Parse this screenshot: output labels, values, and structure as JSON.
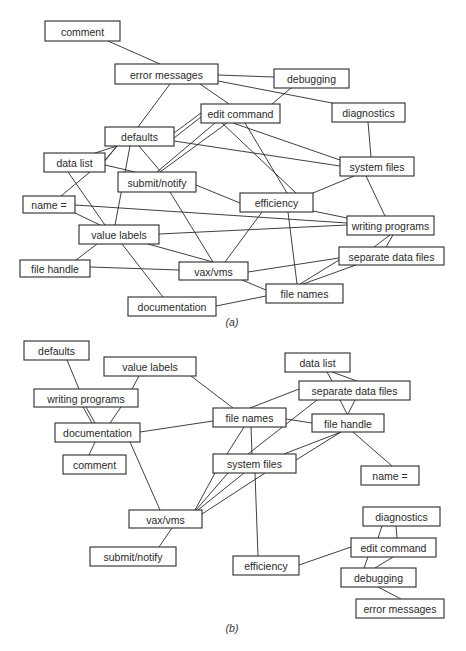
{
  "panels": [
    {
      "id": "a",
      "caption": "(a)",
      "caption_pos": [
        232,
        326
      ],
      "nodes": [
        {
          "id": "comment",
          "label": "comment",
          "x": 45,
          "y": 21,
          "w": 75,
          "h": 20
        },
        {
          "id": "error_messages",
          "label": "error messages",
          "x": 115,
          "y": 64,
          "w": 103,
          "h": 20
        },
        {
          "id": "debugging",
          "label": "debugging",
          "x": 274,
          "y": 69,
          "w": 75,
          "h": 19
        },
        {
          "id": "edit_command",
          "label": "edit command",
          "x": 201,
          "y": 104,
          "w": 79,
          "h": 19
        },
        {
          "id": "diagnostics",
          "label": "diagnostics",
          "x": 332,
          "y": 103,
          "w": 73,
          "h": 19
        },
        {
          "id": "defaults",
          "label": "defaults",
          "x": 105,
          "y": 127,
          "w": 69,
          "h": 19
        },
        {
          "id": "data_list",
          "label": "data list",
          "x": 44,
          "y": 153,
          "w": 61,
          "h": 19
        },
        {
          "id": "system_files",
          "label": "system files",
          "x": 340,
          "y": 157,
          "w": 74,
          "h": 19
        },
        {
          "id": "submit_notify",
          "label": "submit/notify",
          "x": 118,
          "y": 172,
          "w": 78,
          "h": 20
        },
        {
          "id": "efficiency",
          "label": "efficiency",
          "x": 240,
          "y": 193,
          "w": 73,
          "h": 19
        },
        {
          "id": "name_eq",
          "label": "name =",
          "x": 23,
          "y": 196,
          "w": 52,
          "h": 17
        },
        {
          "id": "writing_programs",
          "label": "writing programs",
          "x": 347,
          "y": 216,
          "w": 87,
          "h": 19
        },
        {
          "id": "value_labels",
          "label": "value labels",
          "x": 79,
          "y": 225,
          "w": 80,
          "h": 19
        },
        {
          "id": "separate_data_files",
          "label": "separate data files",
          "x": 339,
          "y": 247,
          "w": 105,
          "h": 18
        },
        {
          "id": "file_handle",
          "label": "file handle",
          "x": 20,
          "y": 260,
          "w": 70,
          "h": 17
        },
        {
          "id": "vax_vms",
          "label": "vax/vms",
          "x": 179,
          "y": 262,
          "w": 69,
          "h": 18
        },
        {
          "id": "file_names",
          "label": "file names",
          "x": 266,
          "y": 284,
          "w": 77,
          "h": 19
        },
        {
          "id": "documentation",
          "label": "documentation",
          "x": 128,
          "y": 297,
          "w": 88,
          "h": 19
        }
      ],
      "edges": [
        [
          108,
          41,
          160,
          64
        ],
        [
          218,
          75,
          274,
          77
        ],
        [
          218,
          81,
          332,
          103
        ],
        [
          200,
          84,
          229,
          104
        ],
        [
          170,
          84,
          138,
          127
        ],
        [
          291,
          88,
          272,
          104
        ],
        [
          174,
          133,
          201,
          113
        ],
        [
          174,
          138,
          201,
          117
        ],
        [
          174,
          141,
          340,
          166
        ],
        [
          215,
          123,
          157,
          172
        ],
        [
          227,
          123,
          160,
          172
        ],
        [
          233,
          123,
          340,
          160
        ],
        [
          222,
          123,
          296,
          193
        ],
        [
          245,
          123,
          287,
          193
        ],
        [
          117,
          146,
          95,
          153
        ],
        [
          117,
          146,
          105,
          160
        ],
        [
          117,
          146,
          96,
          172
        ],
        [
          130,
          146,
          115,
          225
        ],
        [
          139,
          146,
          161,
          172
        ],
        [
          105,
          165,
          135,
          172
        ],
        [
          90,
          172,
          61,
          196
        ],
        [
          68,
          172,
          105,
          225
        ],
        [
          196,
          185,
          240,
          203
        ],
        [
          170,
          192,
          213,
          262
        ],
        [
          262,
          212,
          225,
          262
        ],
        [
          288,
          212,
          297,
          284
        ],
        [
          313,
          211,
          347,
          218
        ],
        [
          75,
          205,
          347,
          223
        ],
        [
          159,
          234,
          347,
          225
        ],
        [
          368,
          122,
          371,
          157
        ],
        [
          366,
          176,
          385,
          216
        ],
        [
          354,
          176,
          313,
          193
        ],
        [
          75,
          213,
          100,
          225
        ],
        [
          97,
          244,
          76,
          260
        ],
        [
          90,
          267,
          179,
          270
        ],
        [
          148,
          244,
          213,
          262
        ],
        [
          122,
          244,
          163,
          297
        ],
        [
          248,
          272,
          339,
          258
        ],
        [
          242,
          280,
          266,
          290
        ],
        [
          216,
          306,
          266,
          296
        ],
        [
          300,
          284,
          339,
          260
        ],
        [
          303,
          284,
          356,
          265
        ],
        [
          374,
          247,
          390,
          235
        ],
        [
          386,
          247,
          393,
          235
        ]
      ]
    },
    {
      "id": "b",
      "caption": "(b)",
      "caption_pos": [
        232,
        632
      ],
      "nodes": [
        {
          "id": "defaults",
          "label": "defaults",
          "x": 24,
          "y": 341,
          "w": 65,
          "h": 19
        },
        {
          "id": "value_labels",
          "label": "value labels",
          "x": 104,
          "y": 357,
          "w": 92,
          "h": 19
        },
        {
          "id": "data_list",
          "label": "data list",
          "x": 285,
          "y": 353,
          "w": 65,
          "h": 19
        },
        {
          "id": "writing_programs",
          "label": "writing programs",
          "x": 34,
          "y": 389,
          "w": 104,
          "h": 18
        },
        {
          "id": "separate_data_files",
          "label": "separate data files",
          "x": 299,
          "y": 381,
          "w": 111,
          "h": 19
        },
        {
          "id": "file_names",
          "label": "file names",
          "x": 213,
          "y": 408,
          "w": 73,
          "h": 19
        },
        {
          "id": "file_handle",
          "label": "file handle",
          "x": 312,
          "y": 414,
          "w": 72,
          "h": 18
        },
        {
          "id": "documentation",
          "label": "documentation",
          "x": 55,
          "y": 423,
          "w": 85,
          "h": 19
        },
        {
          "id": "comment",
          "label": "comment",
          "x": 63,
          "y": 455,
          "w": 63,
          "h": 19
        },
        {
          "id": "system_files",
          "label": "system files",
          "x": 213,
          "y": 454,
          "w": 83,
          "h": 19
        },
        {
          "id": "name_eq",
          "label": "name =",
          "x": 361,
          "y": 466,
          "w": 58,
          "h": 19
        },
        {
          "id": "vax_vms",
          "label": "vax/vms",
          "x": 129,
          "y": 510,
          "w": 73,
          "h": 18
        },
        {
          "id": "submit_notify",
          "label": "submit/notify",
          "x": 90,
          "y": 547,
          "w": 86,
          "h": 19
        },
        {
          "id": "diagnostics",
          "label": "diagnostics",
          "x": 363,
          "y": 507,
          "w": 77,
          "h": 19
        },
        {
          "id": "edit_command",
          "label": "edit command",
          "x": 351,
          "y": 538,
          "w": 85,
          "h": 19
        },
        {
          "id": "efficiency",
          "label": "efficiency",
          "x": 233,
          "y": 556,
          "w": 66,
          "h": 19
        },
        {
          "id": "debugging",
          "label": "debugging",
          "x": 341,
          "y": 568,
          "w": 75,
          "h": 19
        },
        {
          "id": "error_messages",
          "label": "error messages",
          "x": 356,
          "y": 599,
          "w": 88,
          "h": 19
        }
      ],
      "edges": [
        [
          67,
          360,
          79,
          389
        ],
        [
          139,
          376,
          132,
          389
        ],
        [
          191,
          376,
          233,
          408
        ],
        [
          83,
          407,
          92,
          423
        ],
        [
          86,
          407,
          95,
          423
        ],
        [
          121,
          407,
          110,
          423
        ],
        [
          140,
          432,
          213,
          421
        ],
        [
          95,
          442,
          89,
          455
        ],
        [
          130,
          442,
          160,
          510
        ],
        [
          327,
          372,
          332,
          381
        ],
        [
          332,
          372,
          357,
          381
        ],
        [
          299,
          389,
          250,
          408
        ],
        [
          340,
          400,
          347,
          414
        ],
        [
          355,
          400,
          348,
          414
        ],
        [
          286,
          419,
          312,
          423
        ],
        [
          317,
          400,
          248,
          454
        ],
        [
          244,
          427,
          227,
          454
        ],
        [
          251,
          427,
          252,
          454
        ],
        [
          341,
          432,
          284,
          454
        ],
        [
          341,
          432,
          296,
          460
        ],
        [
          353,
          432,
          392,
          466
        ],
        [
          215,
          473,
          195,
          510
        ],
        [
          228,
          473,
          196,
          510
        ],
        [
          244,
          473,
          198,
          510
        ],
        [
          265,
          473,
          202,
          514
        ],
        [
          255,
          473,
          258,
          556
        ],
        [
          172,
          528,
          159,
          547
        ],
        [
          299,
          565,
          351,
          547
        ],
        [
          382,
          526,
          378,
          538
        ],
        [
          396,
          526,
          397,
          538
        ],
        [
          368,
          557,
          364,
          568
        ],
        [
          393,
          557,
          375,
          568
        ],
        [
          378,
          587,
          401,
          599
        ]
      ]
    }
  ]
}
